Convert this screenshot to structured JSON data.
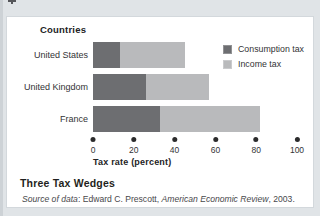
{
  "theme": {
    "background": "#e0e4e7",
    "card_background": "#ffffff",
    "consumption_tax_color": "#6d6e71",
    "income_tax_color": "#b9babc"
  },
  "figure": {
    "axis_heading": "Countries",
    "caption_title": "Three Tax Wedges",
    "source_note": {
      "label_italic": "Source of data",
      "separator": ": ",
      "author": "Edward C. Prescott, ",
      "journal_italic": "American Economic Review",
      "tail": ", 2003."
    }
  },
  "chart_data": {
    "type": "bar",
    "orientation": "horizontal",
    "stacked": true,
    "title": "Three Tax Wedges",
    "ylabel_heading": "Countries",
    "categories": [
      "United States",
      "United Kingdom",
      "France"
    ],
    "series": [
      {
        "name": "Consumption tax",
        "color": "#6d6e71",
        "values": [
          13,
          26,
          33
        ]
      },
      {
        "name": "Income tax",
        "color": "#b9babc",
        "values": [
          32,
          31,
          49
        ]
      }
    ],
    "totals": [
      45,
      57,
      82
    ],
    "xlabel": "Tax rate (percent)",
    "x_ticks": [
      0,
      20,
      40,
      60,
      80,
      100
    ],
    "xlim": [
      0,
      100
    ],
    "tick_marker": "dot",
    "grid": false,
    "legend_position": "right"
  }
}
